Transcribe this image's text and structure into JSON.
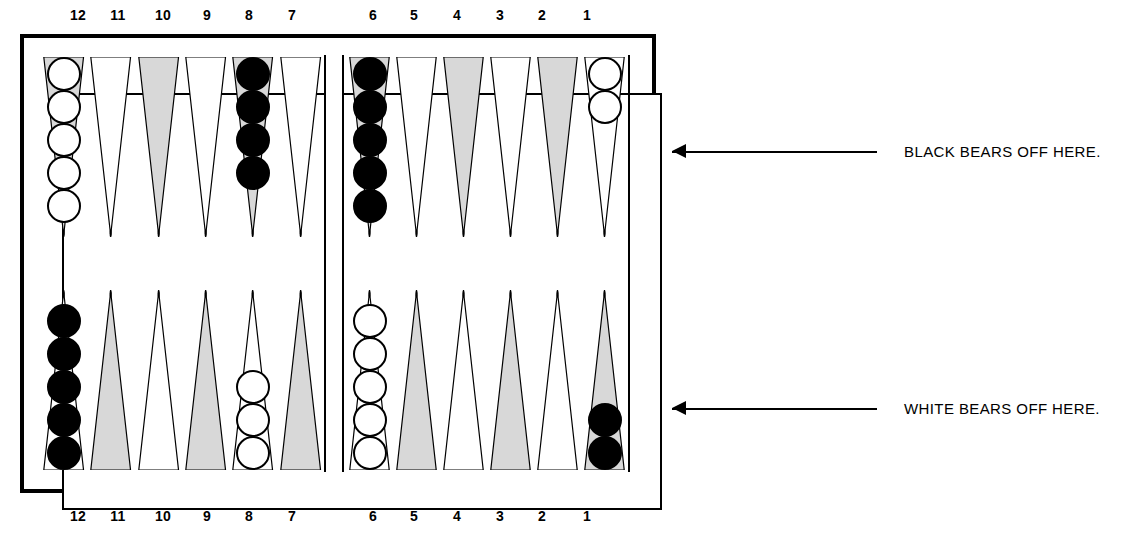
{
  "board": {
    "title": "Backgammon board diagram",
    "point_labels_top": [
      "12",
      "11",
      "10",
      "9",
      "8",
      "7",
      "6",
      "5",
      "4",
      "3",
      "2",
      "1"
    ],
    "point_labels_bottom": [
      "12",
      "11",
      "10",
      "9",
      "8",
      "7",
      "6",
      "5",
      "4",
      "3",
      "2",
      "1"
    ],
    "label_x_top": [
      78,
      118,
      163,
      207,
      249,
      292,
      373,
      414,
      457,
      500,
      542,
      587
    ],
    "label_x_bottom": [
      78,
      118,
      163,
      207,
      249,
      292,
      373,
      414,
      457,
      500,
      542,
      587
    ],
    "colors": {
      "line": "#000000",
      "checker_white": "#ffffff",
      "checker_black": "#000000",
      "point_shaded": "#d8d8d8",
      "point_plain": "#ffffff",
      "background": "#ffffff"
    },
    "quadrants": {
      "top_left": {
        "points": [
          {
            "label": "12",
            "shaded": true,
            "checkers": 5,
            "color": "white"
          },
          {
            "label": "11",
            "shaded": false,
            "checkers": 0,
            "color": ""
          },
          {
            "label": "10",
            "shaded": true,
            "checkers": 0,
            "color": ""
          },
          {
            "label": "9",
            "shaded": false,
            "checkers": 0,
            "color": ""
          },
          {
            "label": "8",
            "shaded": true,
            "checkers": 4,
            "color": "black"
          },
          {
            "label": "7",
            "shaded": false,
            "checkers": 0,
            "color": ""
          }
        ]
      },
      "top_right": {
        "points": [
          {
            "label": "6",
            "shaded": true,
            "checkers": 5,
            "color": "black"
          },
          {
            "label": "5",
            "shaded": false,
            "checkers": 0,
            "color": ""
          },
          {
            "label": "4",
            "shaded": true,
            "checkers": 0,
            "color": ""
          },
          {
            "label": "3",
            "shaded": false,
            "checkers": 0,
            "color": ""
          },
          {
            "label": "2",
            "shaded": true,
            "checkers": 0,
            "color": ""
          },
          {
            "label": "1",
            "shaded": false,
            "checkers": 2,
            "color": "white"
          }
        ]
      },
      "bottom_left": {
        "points": [
          {
            "label": "12",
            "shaded": false,
            "checkers": 5,
            "color": "black"
          },
          {
            "label": "11",
            "shaded": true,
            "checkers": 0,
            "color": ""
          },
          {
            "label": "10",
            "shaded": false,
            "checkers": 0,
            "color": ""
          },
          {
            "label": "9",
            "shaded": true,
            "checkers": 0,
            "color": ""
          },
          {
            "label": "8",
            "shaded": false,
            "checkers": 3,
            "color": "white"
          },
          {
            "label": "7",
            "shaded": true,
            "checkers": 0,
            "color": ""
          }
        ]
      },
      "bottom_right": {
        "points": [
          {
            "label": "6",
            "shaded": false,
            "checkers": 5,
            "color": "white"
          },
          {
            "label": "5",
            "shaded": true,
            "checkers": 0,
            "color": ""
          },
          {
            "label": "4",
            "shaded": false,
            "checkers": 0,
            "color": ""
          },
          {
            "label": "3",
            "shaded": true,
            "checkers": 0,
            "color": ""
          },
          {
            "label": "2",
            "shaded": false,
            "checkers": 0,
            "color": ""
          },
          {
            "label": "1",
            "shaded": true,
            "checkers": 2,
            "color": "black"
          }
        ]
      }
    }
  },
  "annotations": {
    "black": {
      "text": "BLACK BEARS OFF HERE.",
      "arrow": "arrow-left"
    },
    "white": {
      "text": "WHITE BEARS OFF HERE.",
      "arrow": "arrow-left"
    }
  }
}
